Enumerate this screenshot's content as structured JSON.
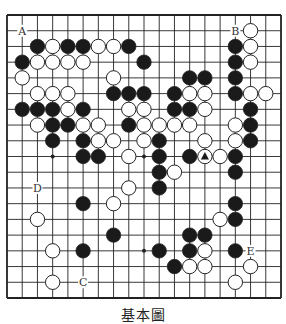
{
  "diagram": {
    "type": "go-board",
    "size": 19,
    "caption": "基本圖",
    "colors": {
      "background": "#ffffff",
      "line": "#222222",
      "black_stone": "#1a1a1a",
      "white_stone": "#ffffff",
      "stone_outline": "#222222"
    },
    "star_points": [
      [
        3,
        9
      ],
      [
        9,
        9
      ],
      [
        9,
        15
      ]
    ],
    "stones": [
      {
        "row": 1,
        "col": 16,
        "color": "white"
      },
      {
        "row": 2,
        "col": 2,
        "color": "black"
      },
      {
        "row": 2,
        "col": 3,
        "color": "white"
      },
      {
        "row": 2,
        "col": 4,
        "color": "black"
      },
      {
        "row": 2,
        "col": 5,
        "color": "black"
      },
      {
        "row": 2,
        "col": 6,
        "color": "white"
      },
      {
        "row": 2,
        "col": 7,
        "color": "white"
      },
      {
        "row": 2,
        "col": 8,
        "color": "black"
      },
      {
        "row": 2,
        "col": 15,
        "color": "black"
      },
      {
        "row": 2,
        "col": 16,
        "color": "white"
      },
      {
        "row": 3,
        "col": 1,
        "color": "black"
      },
      {
        "row": 3,
        "col": 2,
        "color": "white"
      },
      {
        "row": 3,
        "col": 3,
        "color": "white"
      },
      {
        "row": 3,
        "col": 4,
        "color": "white"
      },
      {
        "row": 3,
        "col": 5,
        "color": "white"
      },
      {
        "row": 3,
        "col": 9,
        "color": "black"
      },
      {
        "row": 3,
        "col": 15,
        "color": "black"
      },
      {
        "row": 3,
        "col": 16,
        "color": "white"
      },
      {
        "row": 4,
        "col": 1,
        "color": "white"
      },
      {
        "row": 4,
        "col": 7,
        "color": "white"
      },
      {
        "row": 4,
        "col": 12,
        "color": "black"
      },
      {
        "row": 4,
        "col": 13,
        "color": "black"
      },
      {
        "row": 4,
        "col": 15,
        "color": "black"
      },
      {
        "row": 5,
        "col": 2,
        "color": "white"
      },
      {
        "row": 5,
        "col": 3,
        "color": "white"
      },
      {
        "row": 5,
        "col": 4,
        "color": "white"
      },
      {
        "row": 5,
        "col": 7,
        "color": "black"
      },
      {
        "row": 5,
        "col": 8,
        "color": "black"
      },
      {
        "row": 5,
        "col": 9,
        "color": "black"
      },
      {
        "row": 5,
        "col": 11,
        "color": "black"
      },
      {
        "row": 5,
        "col": 12,
        "color": "white"
      },
      {
        "row": 5,
        "col": 13,
        "color": "white"
      },
      {
        "row": 5,
        "col": 15,
        "color": "black"
      },
      {
        "row": 5,
        "col": 16,
        "color": "white"
      },
      {
        "row": 5,
        "col": 17,
        "color": "white"
      },
      {
        "row": 6,
        "col": 1,
        "color": "black"
      },
      {
        "row": 6,
        "col": 2,
        "color": "black"
      },
      {
        "row": 6,
        "col": 3,
        "color": "black"
      },
      {
        "row": 6,
        "col": 4,
        "color": "white"
      },
      {
        "row": 6,
        "col": 5,
        "color": "black"
      },
      {
        "row": 6,
        "col": 8,
        "color": "white"
      },
      {
        "row": 6,
        "col": 9,
        "color": "white"
      },
      {
        "row": 6,
        "col": 11,
        "color": "black"
      },
      {
        "row": 6,
        "col": 12,
        "color": "black"
      },
      {
        "row": 6,
        "col": 13,
        "color": "white"
      },
      {
        "row": 6,
        "col": 16,
        "color": "black"
      },
      {
        "row": 7,
        "col": 2,
        "color": "white"
      },
      {
        "row": 7,
        "col": 3,
        "color": "black"
      },
      {
        "row": 7,
        "col": 4,
        "color": "black"
      },
      {
        "row": 7,
        "col": 5,
        "color": "white"
      },
      {
        "row": 7,
        "col": 6,
        "color": "white"
      },
      {
        "row": 7,
        "col": 8,
        "color": "black"
      },
      {
        "row": 7,
        "col": 9,
        "color": "white"
      },
      {
        "row": 7,
        "col": 10,
        "color": "white"
      },
      {
        "row": 7,
        "col": 11,
        "color": "white"
      },
      {
        "row": 7,
        "col": 12,
        "color": "white"
      },
      {
        "row": 7,
        "col": 15,
        "color": "white"
      },
      {
        "row": 7,
        "col": 16,
        "color": "black"
      },
      {
        "row": 8,
        "col": 3,
        "color": "black"
      },
      {
        "row": 8,
        "col": 5,
        "color": "black"
      },
      {
        "row": 8,
        "col": 6,
        "color": "white"
      },
      {
        "row": 8,
        "col": 7,
        "color": "white"
      },
      {
        "row": 8,
        "col": 9,
        "color": "white"
      },
      {
        "row": 8,
        "col": 10,
        "color": "black"
      },
      {
        "row": 8,
        "col": 13,
        "color": "white"
      },
      {
        "row": 8,
        "col": 15,
        "color": "white"
      },
      {
        "row": 8,
        "col": 16,
        "color": "black"
      },
      {
        "row": 9,
        "col": 5,
        "color": "black"
      },
      {
        "row": 9,
        "col": 6,
        "color": "black"
      },
      {
        "row": 9,
        "col": 8,
        "color": "white"
      },
      {
        "row": 9,
        "col": 10,
        "color": "black"
      },
      {
        "row": 9,
        "col": 12,
        "color": "black"
      },
      {
        "row": 9,
        "col": 13,
        "color": "white",
        "mark": "triangle"
      },
      {
        "row": 9,
        "col": 14,
        "color": "white"
      },
      {
        "row": 9,
        "col": 15,
        "color": "black"
      },
      {
        "row": 10,
        "col": 10,
        "color": "black"
      },
      {
        "row": 10,
        "col": 11,
        "color": "white"
      },
      {
        "row": 10,
        "col": 15,
        "color": "black"
      },
      {
        "row": 11,
        "col": 8,
        "color": "white"
      },
      {
        "row": 11,
        "col": 10,
        "color": "black"
      },
      {
        "row": 12,
        "col": 5,
        "color": "black"
      },
      {
        "row": 12,
        "col": 7,
        "color": "white"
      },
      {
        "row": 12,
        "col": 15,
        "color": "black"
      },
      {
        "row": 13,
        "col": 2,
        "color": "white"
      },
      {
        "row": 13,
        "col": 14,
        "color": "white"
      },
      {
        "row": 13,
        "col": 15,
        "color": "black"
      },
      {
        "row": 14,
        "col": 7,
        "color": "black"
      },
      {
        "row": 14,
        "col": 12,
        "color": "black"
      },
      {
        "row": 14,
        "col": 13,
        "color": "black"
      },
      {
        "row": 15,
        "col": 3,
        "color": "white"
      },
      {
        "row": 15,
        "col": 5,
        "color": "black"
      },
      {
        "row": 15,
        "col": 10,
        "color": "black"
      },
      {
        "row": 15,
        "col": 12,
        "color": "black"
      },
      {
        "row": 15,
        "col": 13,
        "color": "white"
      },
      {
        "row": 15,
        "col": 15,
        "color": "black"
      },
      {
        "row": 16,
        "col": 11,
        "color": "black"
      },
      {
        "row": 16,
        "col": 12,
        "color": "white"
      },
      {
        "row": 16,
        "col": 13,
        "color": "white"
      },
      {
        "row": 16,
        "col": 16,
        "color": "white"
      },
      {
        "row": 17,
        "col": 3,
        "color": "white"
      },
      {
        "row": 17,
        "col": 15,
        "color": "white"
      }
    ],
    "labels": [
      {
        "row": 1,
        "col": 1,
        "text": "A"
      },
      {
        "row": 1,
        "col": 15,
        "text": "B"
      },
      {
        "row": 17,
        "col": 5,
        "text": "C"
      },
      {
        "row": 11,
        "col": 2,
        "text": "D"
      },
      {
        "row": 15,
        "col": 16,
        "text": "E"
      }
    ]
  }
}
